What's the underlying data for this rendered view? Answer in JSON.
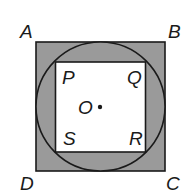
{
  "diagram": {
    "colors": {
      "shade": "#9a9a9a",
      "stroke": "#1a1a1a",
      "inner": "#ffffff"
    },
    "outer_square": {
      "labels": [
        "A",
        "B",
        "C",
        "D"
      ]
    },
    "inner_square": {
      "labels": [
        "P",
        "Q",
        "R",
        "S"
      ]
    },
    "circle": {
      "center_label": "O"
    }
  }
}
